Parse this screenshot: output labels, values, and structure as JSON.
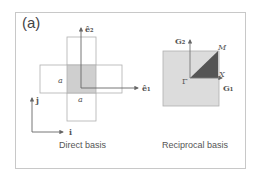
{
  "figure": {
    "panel_label": "(a)",
    "direct": {
      "caption": "Direct basis",
      "axis_e1": "ê₁",
      "axis_e2": "ê₂",
      "side_label_left": "a",
      "side_label_bottom": "a",
      "basis_i": "i",
      "basis_j": "j"
    },
    "reciprocal": {
      "caption": "Reciprocal basis",
      "axis_G1": "G₁",
      "axis_G2": "G₂",
      "point_gamma": "Γ",
      "point_X": "X",
      "point_M": "M"
    },
    "colors": {
      "frame": "#c8c8c8",
      "cross_outline": "#b0b0b0",
      "cell_shade": "#cfcfcf",
      "bz_fill": "#dcdcdc",
      "irreducible_wedge": "#555555",
      "axis": "#666666"
    }
  }
}
